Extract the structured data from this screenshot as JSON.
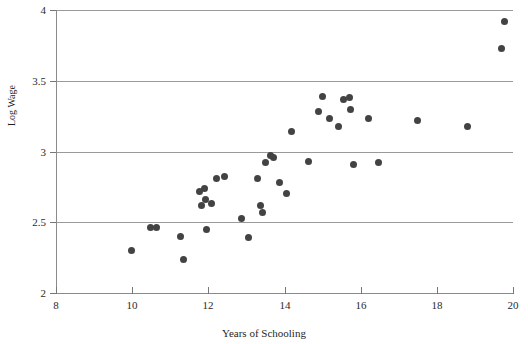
{
  "chart_data": {
    "type": "scatter",
    "title": "",
    "xlabel": "Years of Schooling",
    "ylabel": "Log Wage",
    "xlim": [
      8,
      20
    ],
    "ylim": [
      2,
      4
    ],
    "xticks": [
      8,
      10,
      12,
      14,
      16,
      18,
      20
    ],
    "xticklabels": [
      "8",
      "10",
      "12",
      "14",
      "16",
      "18",
      "20"
    ],
    "yticks": [
      2,
      2.5,
      3,
      3.5,
      4
    ],
    "yticklabels": [
      "2",
      "2.5",
      "3",
      "3.5",
      "4"
    ],
    "grid": "horizontal",
    "legend": "none",
    "marker_color": "#434343",
    "marker_shape": "circle",
    "gridline_color": "#9a9a9a",
    "axis_color": "#8a8a8a",
    "series": [
      {
        "name": "observations",
        "points": [
          [
            9.97,
            2.3
          ],
          [
            10.47,
            2.46
          ],
          [
            10.65,
            2.46
          ],
          [
            11.27,
            2.4
          ],
          [
            11.35,
            2.24
          ],
          [
            11.78,
            2.72
          ],
          [
            11.82,
            2.62
          ],
          [
            11.9,
            2.74
          ],
          [
            11.92,
            2.66
          ],
          [
            11.95,
            2.45
          ],
          [
            12.08,
            2.63
          ],
          [
            12.22,
            2.81
          ],
          [
            12.42,
            2.82
          ],
          [
            12.88,
            2.53
          ],
          [
            13.05,
            2.39
          ],
          [
            13.3,
            2.81
          ],
          [
            13.38,
            2.62
          ],
          [
            13.42,
            2.57
          ],
          [
            13.5,
            2.92
          ],
          [
            13.62,
            2.97
          ],
          [
            13.7,
            2.96
          ],
          [
            13.88,
            2.78
          ],
          [
            14.05,
            2.7
          ],
          [
            14.18,
            3.14
          ],
          [
            14.62,
            2.93
          ],
          [
            14.9,
            3.28
          ],
          [
            15.0,
            3.39
          ],
          [
            15.18,
            3.23
          ],
          [
            15.42,
            3.18
          ],
          [
            15.55,
            3.37
          ],
          [
            15.7,
            3.38
          ],
          [
            15.72,
            3.3
          ],
          [
            15.8,
            2.91
          ],
          [
            16.2,
            3.23
          ],
          [
            16.48,
            2.92
          ],
          [
            17.48,
            3.22
          ],
          [
            18.8,
            3.18
          ],
          [
            19.7,
            3.73
          ],
          [
            19.78,
            3.92
          ]
        ]
      }
    ]
  }
}
